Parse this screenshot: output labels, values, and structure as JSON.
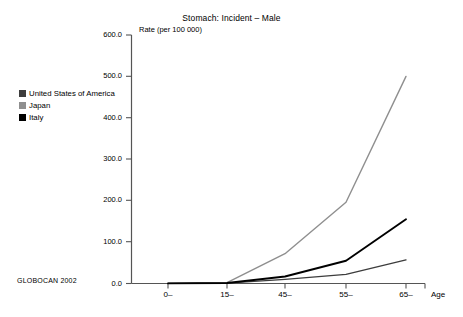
{
  "chart_data": {
    "type": "line",
    "title": "Stomach: Incident – Male",
    "ylabel": "Rate (per 100 000)",
    "xlabel": "Age",
    "categories": [
      "0–",
      "15–",
      "45–",
      "55–",
      "65–"
    ],
    "y_ticks": [
      "0.0",
      "100.0",
      "200.0",
      "300.0",
      "400.0",
      "500.0",
      "600.0"
    ],
    "y_tick_values": [
      0,
      100,
      200,
      300,
      400,
      500,
      600
    ],
    "ylim": [
      0,
      600
    ],
    "grid": false,
    "legend_position": "upper-left-outside",
    "series": [
      {
        "name": "United States of America",
        "color": "#3d3d3d",
        "values": [
          0.3,
          0.9,
          10,
          22,
          57
        ]
      },
      {
        "name": "Japan",
        "color": "#8f8f8f",
        "values": [
          0.3,
          2.0,
          72,
          196,
          500
        ]
      },
      {
        "name": "Italy",
        "color": "#000000",
        "values": [
          0.3,
          1.2,
          17,
          55,
          155
        ]
      }
    ],
    "annotations": [
      "GLOBOCAN 2002"
    ]
  },
  "figure": {
    "title": "Stomach: Incident – Male",
    "y_axis_label": "Rate (per 100 000)",
    "x_axis_label": "Age",
    "source_note": "GLOBOCAN 2002",
    "y_tick_labels": [
      "600.0",
      "500.0",
      "400.0",
      "300.0",
      "200.0",
      "100.0",
      "0.0"
    ],
    "x_tick_labels": [
      "0–",
      "15–",
      "45–",
      "55–",
      "65–"
    ],
    "legend": [
      {
        "label": "United States of America",
        "color": "#3d3d3d"
      },
      {
        "label": "Japan",
        "color": "#8f8f8f"
      },
      {
        "label": "Italy",
        "color": "#000000"
      }
    ],
    "axis_color": "#555555"
  }
}
